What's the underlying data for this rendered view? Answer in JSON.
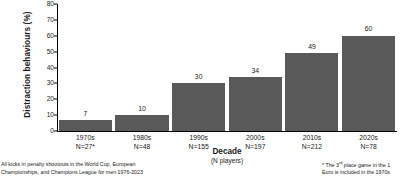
{
  "chart_data": {
    "type": "bar",
    "title": "",
    "xlabel": "Decade",
    "xlabel_sub": "(N players)",
    "ylabel": "Distraction behaviours (%)",
    "ylim": [
      0,
      80
    ],
    "yticks": [
      0,
      10,
      20,
      30,
      40,
      50,
      60,
      70,
      80
    ],
    "grid": false,
    "legend": "none",
    "bar_color": "#595959",
    "categories": [
      "1970s",
      "1980s",
      "1990s",
      "2000s",
      "2010s",
      "2020s"
    ],
    "values": [
      7,
      10,
      30,
      34,
      49,
      60
    ],
    "n_labels": [
      "N=27*",
      "N=48",
      "N=155",
      "N=197",
      "N=212",
      "N=78"
    ],
    "n_values": [
      27,
      48,
      155,
      197,
      212,
      78
    ],
    "bars": [
      {
        "category": "1970s",
        "value": 7,
        "value_label": "7",
        "n_label": "N=27*"
      },
      {
        "category": "1980s",
        "value": 10,
        "value_label": "10",
        "n_label": "N=48"
      },
      {
        "category": "1990s",
        "value": 30,
        "value_label": "30",
        "n_label": "N=155"
      },
      {
        "category": "2000s",
        "value": 34,
        "value_label": "34",
        "n_label": "N=197"
      },
      {
        "category": "2010s",
        "value": 49,
        "value_label": "49",
        "n_label": "N=212"
      },
      {
        "category": "2020s",
        "value": 60,
        "value_label": "60",
        "n_label": "N=78"
      }
    ]
  },
  "footnotes": {
    "left_line1": "All kicks in penalty shootouts in the World Cup, European",
    "left_line2": "Championships, and Champions League for men 1976-2023",
    "right_line1_pre": "* The 3",
    "right_line1_sup": "rd",
    "right_line1_post": " place game in the 1",
    "right_line2": "Euro is included in the 1970s"
  }
}
